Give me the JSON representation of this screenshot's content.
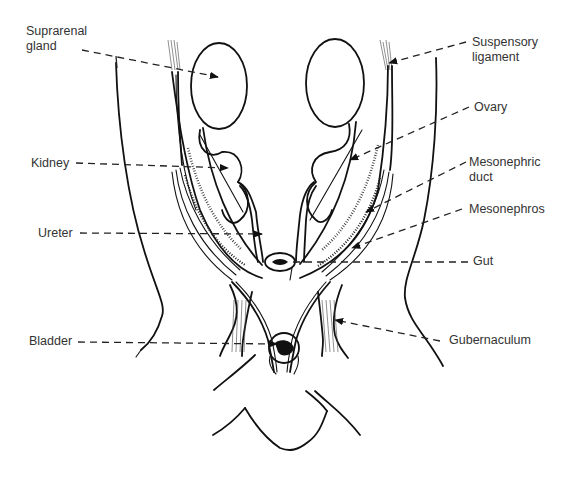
{
  "diagram": {
    "labels_left": [
      {
        "id": "suprarenal-gland",
        "text": "Suprarenal\ngland"
      },
      {
        "id": "kidney",
        "text": "Kidney"
      },
      {
        "id": "ureter",
        "text": "Ureter"
      },
      {
        "id": "bladder",
        "text": "Bladder"
      }
    ],
    "labels_right": [
      {
        "id": "suspensory-ligament",
        "text": "Suspensory\nligament"
      },
      {
        "id": "ovary",
        "text": "Ovary"
      },
      {
        "id": "mesonephric-duct",
        "text": "Mesonephric\nduct"
      },
      {
        "id": "mesonephros",
        "text": "Mesonephros"
      },
      {
        "id": "gut",
        "text": "Gut"
      },
      {
        "id": "gubernaculum",
        "text": "Gubernaculum"
      }
    ],
    "colors": {
      "ink": "#111111",
      "text": "#333333",
      "background": "#ffffff"
    }
  }
}
